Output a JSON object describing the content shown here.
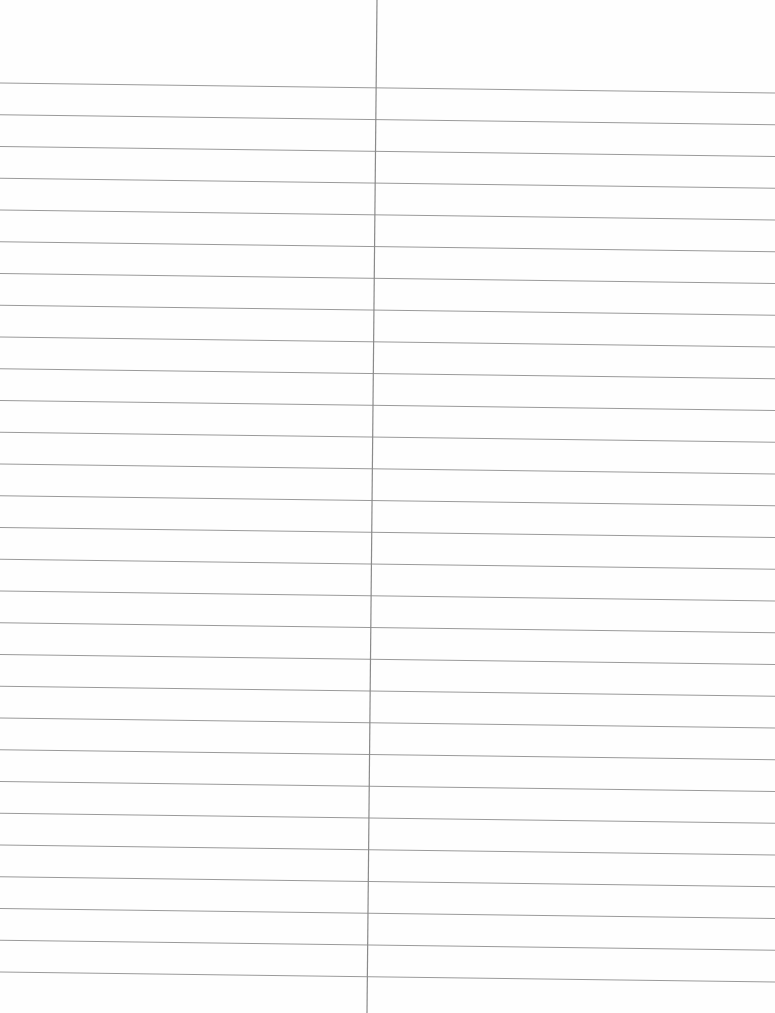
{
  "page": {
    "type": "blank lined paper with vertical divider",
    "background_color": "#fefefe",
    "rule_color": "#9a9a9a",
    "divider_color": "#8a8a8a",
    "rule_count": 29,
    "first_rule_y_left": 83,
    "rule_spacing": 31.75,
    "rule_drop_across_width": 10,
    "divider_x_top": 377,
    "divider_x_bottom": 367
  }
}
